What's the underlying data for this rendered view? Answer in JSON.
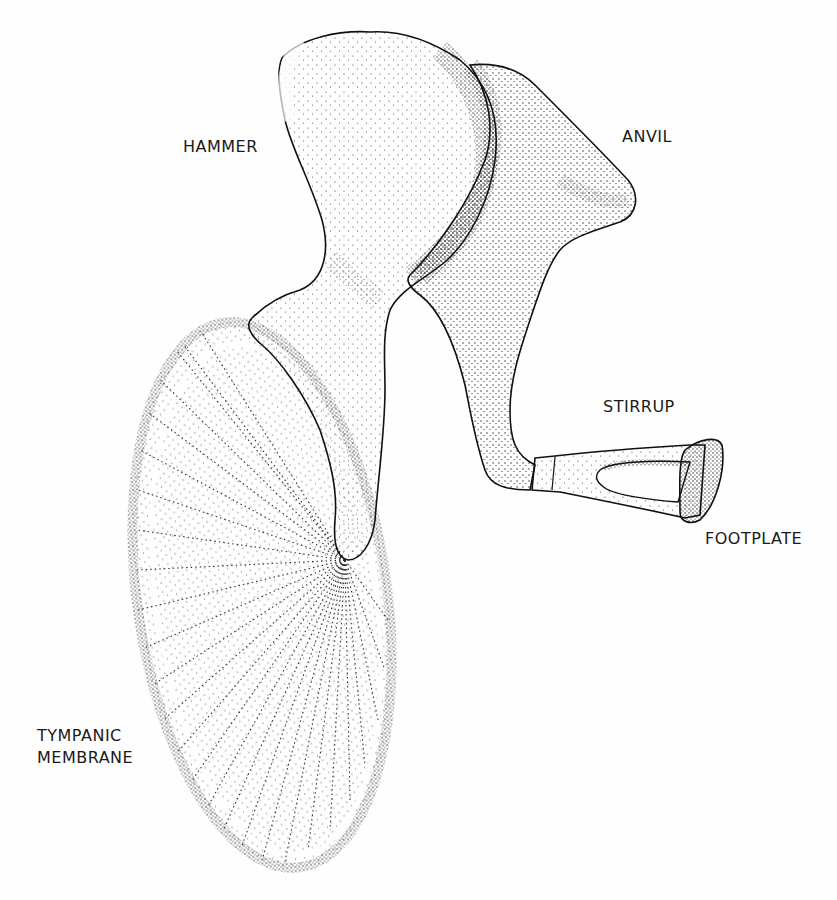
{
  "diagram": {
    "title": "",
    "colors": {
      "ink": "#1a1a1a",
      "background": "#fefefe"
    },
    "labels": {
      "hammer": "HAMMER",
      "anvil": "ANVIL",
      "stirrup": "STIRRUP",
      "footplate": "FOOTPLATE",
      "tympanic_line1": "TYMPANIC",
      "tympanic_line2": "MEMBRANE"
    }
  }
}
